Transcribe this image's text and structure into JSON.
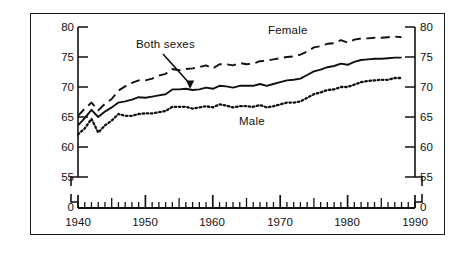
{
  "figure": {
    "ylabel": "Years",
    "background": "#ffffff",
    "ink": "#111111"
  },
  "annotations": [
    {
      "name": "both-sexes",
      "text": "Both sexes",
      "x": 136,
      "y": 44
    },
    {
      "name": "female",
      "text": "Female",
      "x": 268,
      "y": 31
    },
    {
      "name": "male",
      "text": "Male",
      "x": 239,
      "y": 122
    }
  ],
  "axes": {
    "y_ticks": [
      "80",
      "75",
      "70",
      "65",
      "60",
      "55",
      "0"
    ],
    "x_ticks": [
      "1940",
      "1950",
      "1960",
      "1970",
      "1980",
      "1990"
    ],
    "y_break_between": [
      "55",
      "0"
    ]
  },
  "chart_data": {
    "type": "line",
    "title": "",
    "subtitle": "",
    "xlabel": "",
    "ylabel": "Years",
    "xlim": [
      1940,
      1990
    ],
    "ylim": [
      55,
      80
    ],
    "y_axis_broken": true,
    "y_break_label": "0",
    "grid": false,
    "legend": "inline-annotations",
    "x": [
      1940,
      1941,
      1942,
      1943,
      1944,
      1945,
      1946,
      1947,
      1948,
      1949,
      1950,
      1951,
      1952,
      1953,
      1954,
      1955,
      1956,
      1957,
      1958,
      1959,
      1960,
      1961,
      1962,
      1963,
      1964,
      1965,
      1966,
      1967,
      1968,
      1969,
      1970,
      1971,
      1972,
      1973,
      1974,
      1975,
      1976,
      1977,
      1978,
      1979,
      1980,
      1981,
      1982,
      1983,
      1984,
      1985,
      1986,
      1987,
      1988
    ],
    "series": [
      {
        "name": "Female",
        "style": "dashed",
        "values": [
          65.2,
          66.4,
          67.4,
          66.1,
          67.2,
          68.0,
          69.4,
          70.1,
          70.7,
          71.1,
          71.1,
          71.4,
          71.9,
          72.2,
          73.0,
          72.8,
          73.0,
          73.1,
          73.3,
          73.6,
          73.1,
          73.8,
          73.8,
          73.6,
          74.0,
          73.8,
          73.9,
          74.3,
          74.4,
          74.6,
          74.8,
          75.0,
          75.1,
          75.4,
          75.9,
          76.6,
          76.8,
          77.2,
          77.3,
          77.8,
          77.4,
          77.9,
          78.1,
          78.1,
          78.2,
          78.2,
          78.3,
          78.4,
          78.3
        ]
      },
      {
        "name": "Both sexes",
        "style": "solid",
        "values": [
          63.6,
          64.8,
          66.2,
          65.0,
          65.9,
          66.6,
          67.4,
          67.6,
          67.9,
          68.3,
          68.2,
          68.4,
          68.6,
          68.8,
          69.6,
          69.6,
          69.7,
          69.5,
          69.6,
          69.9,
          69.7,
          70.2,
          70.1,
          69.9,
          70.2,
          70.2,
          70.2,
          70.5,
          70.2,
          70.5,
          70.8,
          71.1,
          71.2,
          71.4,
          72.0,
          72.6,
          72.9,
          73.3,
          73.5,
          73.9,
          73.7,
          74.2,
          74.5,
          74.6,
          74.7,
          74.7,
          74.8,
          74.9,
          74.9
        ]
      },
      {
        "name": "Male",
        "style": "dotted",
        "values": [
          62.1,
          63.1,
          64.7,
          62.4,
          63.6,
          64.4,
          65.5,
          65.2,
          65.2,
          65.5,
          65.6,
          65.6,
          65.8,
          66.0,
          66.7,
          66.7,
          66.7,
          66.4,
          66.6,
          66.8,
          66.6,
          67.1,
          66.9,
          66.6,
          66.8,
          66.8,
          66.7,
          67.0,
          66.6,
          66.8,
          67.1,
          67.4,
          67.4,
          67.6,
          68.2,
          68.8,
          69.1,
          69.5,
          69.6,
          70.0,
          70.0,
          70.4,
          70.8,
          71.0,
          71.1,
          71.2,
          71.2,
          71.5,
          71.5
        ]
      }
    ]
  }
}
